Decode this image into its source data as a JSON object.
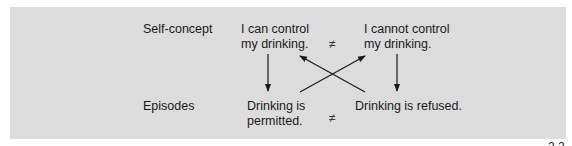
{
  "diagram": {
    "rows": {
      "self_concept_label": "Self-concept",
      "episodes_label": "Episodes"
    },
    "nodes": {
      "can_control": {
        "line1": "I can control",
        "line2": "my drinking."
      },
      "cannot_control": {
        "line1": "I cannot control",
        "line2": "my drinking."
      },
      "permitted": {
        "line1": "Drinking is",
        "line2": "permitted."
      },
      "refused": {
        "line1": "Drinking is refused."
      }
    },
    "symbols": {
      "not_equal_top": "≠",
      "not_equal_bottom": "≠"
    },
    "edges": [
      {
        "from": "can_control",
        "to": "permitted"
      },
      {
        "from": "cannot_control",
        "to": "refused"
      },
      {
        "from": "permitted",
        "to": "cannot_control"
      },
      {
        "from": "refused",
        "to": "can_control"
      }
    ],
    "colors": {
      "panel": "#dcdcdc",
      "ink": "#1a1a1a"
    },
    "cropped_caption_fragment": "2.2"
  }
}
